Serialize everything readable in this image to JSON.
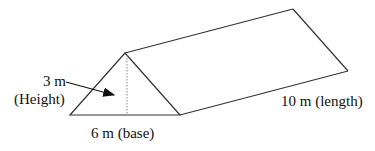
{
  "diagram": {
    "type": "triangular-prism",
    "labels": {
      "height_value": "3 m",
      "height_name": "(Height)",
      "base": "6 m (base)",
      "length": "10 m (length)"
    },
    "colors": {
      "stroke": "#333333",
      "text": "#111111",
      "background": "#ffffff"
    }
  }
}
